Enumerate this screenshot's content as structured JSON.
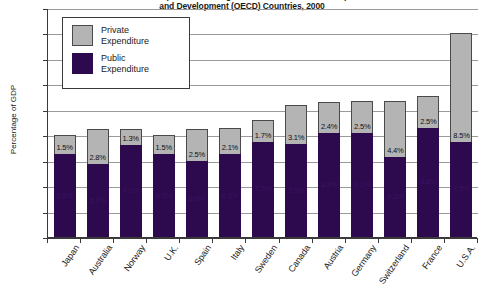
{
  "chart_data": {
    "type": "bar",
    "subtype": "stacked-column",
    "title": "Total Health Expenditure in Organisation for Economic Co-operation\nand Development (OECD) Countries, 2000",
    "xlabel": "",
    "ylabel": "Percentage of GDP",
    "ylim": [
      0,
      18
    ],
    "ytick_labels": [
      "0%",
      "2%",
      "4%",
      "6%",
      "8%",
      "10%",
      "12%",
      "14%",
      "16%",
      "18%"
    ],
    "ytick_values": [
      0,
      2,
      4,
      6,
      8,
      10,
      12,
      14,
      16,
      18
    ],
    "grid": true,
    "legend_position": "upper-left-inside",
    "categories": [
      "Japan",
      "Australia",
      "Norway",
      "U.K.",
      "Spain",
      "Italy",
      "Sweden",
      "Canada",
      "Austria",
      "Germany",
      "Switzerland",
      "France",
      "U.S.A."
    ],
    "series": [
      {
        "name": "Public Expenditure",
        "color": "#2d0a4e",
        "values": [
          6.5,
          5.7,
          7.2,
          6.5,
          6.0,
          6.5,
          7.5,
          7.3,
          8.2,
          8.2,
          6.3,
          8.6,
          7.5
        ],
        "labels": [
          "6.5%",
          "5.7%",
          "7.2%",
          "6.5%",
          "6.0%",
          "6.5%",
          "7.5%",
          "7.3%",
          "8.2%",
          "8.2%",
          "6.3%",
          "8.6%",
          "7.5%"
        ]
      },
      {
        "name": "Private Expenditure",
        "color": "#b4b4b4",
        "values": [
          1.5,
          2.8,
          1.3,
          1.5,
          2.5,
          2.1,
          1.7,
          3.1,
          2.4,
          2.5,
          4.4,
          2.5,
          8.5
        ],
        "labels": [
          "1.5%",
          "2.8%",
          "1.3%",
          "1.5%",
          "2.5%",
          "2.1%",
          "1.7%",
          "3.1%",
          "2.4%",
          "2.5%",
          "4.4%",
          "2.5%",
          "8.5%"
        ]
      }
    ],
    "totals": [
      8.0,
      8.5,
      8.5,
      8.0,
      8.5,
      8.6,
      9.2,
      10.4,
      10.6,
      10.7,
      10.7,
      11.1,
      16.0
    ]
  },
  "legend": {
    "items": [
      {
        "label": "Private\nExpenditure",
        "swatch": "private"
      },
      {
        "label": "Public\nExpenditure",
        "swatch": "public"
      }
    ]
  }
}
